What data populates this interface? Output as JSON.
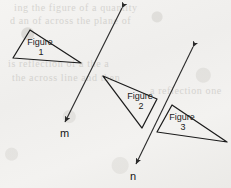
{
  "figure": {
    "kind": "geometry-diagram",
    "background_color": "#f2f1ef",
    "ink_color": "#1b1b1b",
    "ghost_text": {
      "line1": "ing the figure of a quantity",
      "line2": "d an of across the plane of",
      "line3": "is reflection of a the a",
      "line4": "the across line and then",
      "line5": "a reflection one"
    },
    "shapes": [
      {
        "id": "figure-1",
        "label_line_1": "Figure",
        "label_line_2": "1",
        "type": "triangle",
        "points": "30,30 13,58 81,63",
        "label_x": 40,
        "label_y": 45,
        "number_x": 41,
        "number_y": 55
      },
      {
        "id": "figure-2",
        "label_line_1": "Figure",
        "label_line_2": "2",
        "type": "triangle",
        "points": "103,76 157,99 142,128",
        "label_x": 140,
        "label_y": 99,
        "number_x": 141,
        "number_y": 109
      },
      {
        "id": "figure-3",
        "label_line_1": "Figure",
        "label_line_2": "3",
        "type": "triangle",
        "points": "172,105 157,132 227,142",
        "label_x": 182,
        "label_y": 120,
        "number_x": 183,
        "number_y": 130
      }
    ],
    "lines": [
      {
        "id": "line-m",
        "label": "m",
        "x1": 122,
        "y1": 8,
        "x2": 65,
        "y2": 122,
        "label_x": 60,
        "label_y": 137,
        "double_headed": true
      },
      {
        "id": "line-n",
        "label": "n",
        "x1": 193,
        "y1": 47,
        "x2": 136,
        "y2": 164,
        "label_x": 130,
        "label_y": 180,
        "double_headed": true
      }
    ]
  }
}
